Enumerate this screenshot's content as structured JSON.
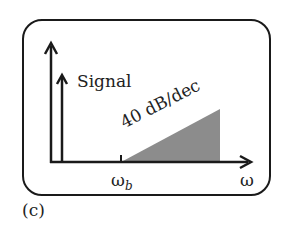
{
  "figure": {
    "panel_label": "(c)",
    "signal_label": "Signal",
    "slope_label": "40 dB/dec",
    "x_axis_label": "ω",
    "break_freq_symbol": "ω",
    "break_freq_subscript": "b",
    "colors": {
      "stroke": "#1a1a1a",
      "noise_fill": "#8c8c8c",
      "background": "#ffffff"
    }
  }
}
